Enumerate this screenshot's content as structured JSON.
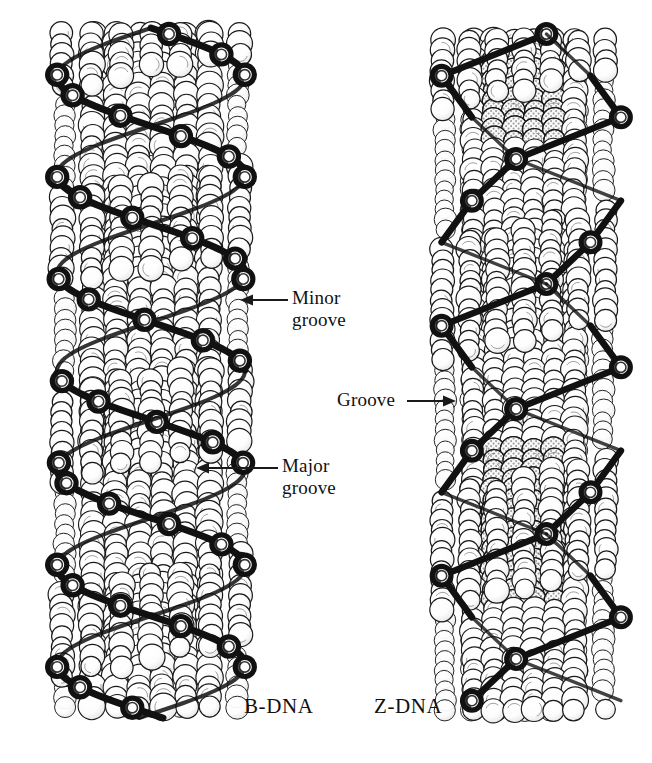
{
  "figure": {
    "background_color": "#ffffff",
    "width": 652,
    "height": 763
  },
  "models": [
    {
      "id": "b-dna",
      "caption": "B-DNA",
      "form": "right-handed double helix",
      "backbone_style": "smooth helical ribbon trace",
      "backbone_color": "#111111",
      "sphere_fill": "#ffffff",
      "sphere_outline": "#1a1a1a",
      "shaded_spheres": false,
      "column": {
        "x": 45,
        "y": 28,
        "width": 212,
        "height": 690
      },
      "turns": 3.2,
      "helix_pitch_px": 196
    },
    {
      "id": "z-dna",
      "caption": "Z-DNA",
      "form": "left-handed zigzag double helix",
      "backbone_style": "angular zigzag trace",
      "backbone_color": "#111111",
      "sphere_fill": "#ffffff",
      "sphere_outline": "#1a1a1a",
      "shaded_spheres": true,
      "shade_color": "#b8b8b8",
      "column": {
        "x": 424,
        "y": 34,
        "width": 200,
        "height": 686
      },
      "turns": 2.6,
      "helix_pitch_px": 250
    }
  ],
  "annotations": [
    {
      "id": "minor-groove",
      "text": "Minor\ngroove",
      "target_model": "b-dna",
      "arrow": {
        "direction": "left",
        "from_x": 288,
        "to_x": 240,
        "y": 300
      }
    },
    {
      "id": "major-groove",
      "text": "Major\ngroove",
      "target_model": "b-dna",
      "arrow": {
        "direction": "left",
        "from_x": 278,
        "to_x": 196,
        "y": 468
      }
    },
    {
      "id": "groove",
      "text": "Groove",
      "target_model": "z-dna",
      "arrow": {
        "direction": "right",
        "from_x": 407,
        "to_x": 456,
        "y": 401
      }
    }
  ],
  "captions": {
    "left": "B-DNA",
    "right": "Z-DNA"
  },
  "colors": {
    "ink": "#111111",
    "outline": "#1a1a1a",
    "sphere_fill": "#ffffff",
    "stipple_gray": "#b8b8b8",
    "background": "#ffffff"
  }
}
